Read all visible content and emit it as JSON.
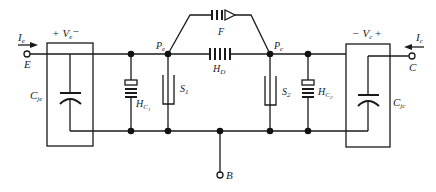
{
  "diagram": {
    "type": "circuit-schematic",
    "terminals": {
      "emitter": {
        "label": "E",
        "current": "I",
        "current_sub": "e"
      },
      "collector": {
        "label": "C",
        "current": "I",
        "current_sub": "c"
      },
      "base": {
        "label": "B"
      }
    },
    "voltages": {
      "emitter": {
        "plus": "+",
        "symbol": "V",
        "sub": "e",
        "minus": "−"
      },
      "collector": {
        "minus": "−",
        "symbol": "V",
        "sub": "c",
        "plus": "+"
      }
    },
    "components": {
      "cje": {
        "label": "C",
        "sub": "je"
      },
      "cjc": {
        "label": "C",
        "sub": "jc"
      },
      "hc1": {
        "label": "H",
        "sub": "C",
        "subsub": "1"
      },
      "hc2": {
        "label": "H",
        "sub": "C",
        "subsub": "2"
      },
      "s1": {
        "label": "S",
        "sub": "1"
      },
      "s2": {
        "label": "S",
        "sub": "2"
      },
      "hd": {
        "label": "H",
        "sub": "D"
      },
      "f": {
        "label": "F"
      }
    },
    "nodes": {
      "pe": {
        "label": "P",
        "sub": "e"
      },
      "pc": {
        "label": "P",
        "sub": "c"
      }
    },
    "colors": {
      "ink": "#1a1a1a",
      "background": "#ffffff"
    }
  }
}
